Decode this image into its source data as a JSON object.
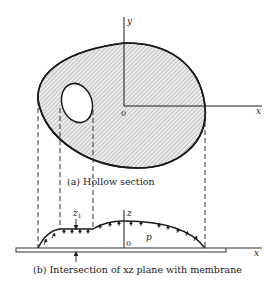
{
  "figure": {
    "part_a": {
      "caption": "(a) Hollow section",
      "axis_x_label": "x",
      "axis_y_label": "y",
      "origin_label": "0"
    },
    "part_b": {
      "caption": "(b) Intersection of xz plane with membrane",
      "axis_x_label": "x",
      "axis_z_label": "z",
      "origin_label": "0",
      "z1_label": "z",
      "z1_subscript": "1",
      "pressure_label": "p"
    },
    "colors": {
      "stroke": "#1a1a1a",
      "hatch": "#8a8a8a",
      "fill": "#e6e6e6"
    }
  }
}
